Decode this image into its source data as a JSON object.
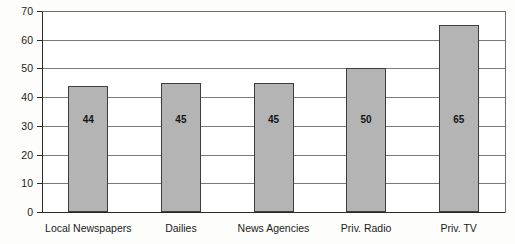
{
  "chart_data": {
    "type": "bar",
    "title": "",
    "subtitle": "",
    "xlabel": "",
    "ylabel": "",
    "categories": [
      "Local Newspapers",
      "Dailies",
      "News Agencies",
      "Priv. Radio",
      "Priv. TV"
    ],
    "values": [
      44,
      45,
      45,
      50,
      65
    ],
    "data_labels": [
      "44",
      "45",
      "45",
      "50",
      "65"
    ],
    "ylim": [
      0,
      70
    ],
    "ytick_step": 10,
    "ytick_labels": [
      "0",
      "10",
      "20",
      "30",
      "40",
      "50",
      "60",
      "70"
    ],
    "ytick_values": [
      0,
      10,
      20,
      30,
      40,
      50,
      60,
      70
    ],
    "grid": true,
    "grid_orientation": "horizontal",
    "legend": false,
    "legend_position": "none",
    "series": [
      {
        "name": "",
        "values": [
          44,
          45,
          45,
          50,
          65
        ]
      }
    ],
    "colors": {
      "bar_fill": "#b4b4b4",
      "bar_border": "#3d3d3d",
      "gridline": "#7a7a7a",
      "axis": "#2a2a2a",
      "text": "#1a1a1a",
      "background": "#ffffff"
    }
  }
}
